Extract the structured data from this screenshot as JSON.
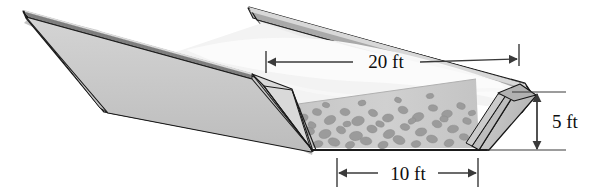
{
  "figure": {
    "kind": "technical-illustration",
    "background_color": "#ffffff"
  },
  "dimensions": [
    {
      "id": "top-width",
      "label": "20 ft",
      "orientation": "horizontal",
      "arrow_style": "double-arrow-with-end-ticks",
      "describes": "length along the top rim of the trough"
    },
    {
      "id": "bottom-width",
      "label": "10 ft",
      "orientation": "horizontal",
      "arrow_style": "double-arrow-with-end-ticks",
      "describes": "width across the flat bottom of the trough"
    },
    {
      "id": "depth",
      "label": "5 ft",
      "orientation": "vertical",
      "arrow_style": "double-arrow-with-end-ticks",
      "describes": "vertical depth of the trough end wall"
    }
  ],
  "colors": {
    "outline": "#1a1a1a",
    "outer_wall": "#c9c9c9",
    "inner_wall_light": "#e8e8e8",
    "inner_wall_mid": "#d2d2d2",
    "rim_dark": "#8d8d8d",
    "rim_top": "#b5b5b5",
    "gravel_bed": "#cdcdcd",
    "gravel_stone": "#9a9a9a",
    "water_surface": "#f6f6f6",
    "dimension_line": "#3a3a3a",
    "label_text": "#0d0d0d",
    "background": "#ffffff"
  },
  "materials": {
    "fill_name": "gravel",
    "stone_count": 46
  }
}
